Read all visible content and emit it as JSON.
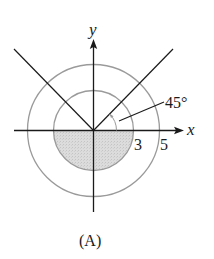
{
  "figure": {
    "caption": "(A)",
    "axes": {
      "x_label": "x",
      "y_label": "y"
    },
    "circles": [
      {
        "name": "inner",
        "radius_label": "3",
        "radius": 3
      },
      {
        "name": "outer",
        "radius_label": "5",
        "radius": 5
      }
    ],
    "angle_label": "45°",
    "rays": [
      {
        "name": "ray-45",
        "angle_deg": 45
      },
      {
        "name": "ray-135",
        "angle_deg": 135
      }
    ],
    "shaded_region": "lower half of disk radius 3",
    "colors": {
      "axis": "#1a1a1a",
      "circle": "#9a9a9a",
      "shade": "#d9d9d9"
    }
  }
}
